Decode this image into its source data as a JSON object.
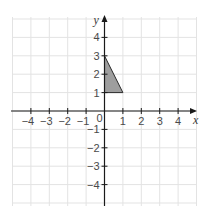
{
  "figure": {
    "grid": {
      "xmin": -5,
      "xmax": 5,
      "ymin": -5,
      "ymax": 5,
      "step": 1,
      "color": "#e3e3e3"
    },
    "axes": {
      "x_label": "x",
      "y_label": "y",
      "origin_label": "0",
      "color": "#1a1a1a",
      "x_ticks": [
        {
          "value": -4,
          "label": "−4"
        },
        {
          "value": -3,
          "label": "−3"
        },
        {
          "value": -2,
          "label": "−2"
        },
        {
          "value": -1,
          "label": "−1"
        },
        {
          "value": 1,
          "label": "1"
        },
        {
          "value": 2,
          "label": "2"
        },
        {
          "value": 3,
          "label": "3"
        },
        {
          "value": 4,
          "label": "4"
        }
      ],
      "y_ticks": [
        {
          "value": 4,
          "label": "4"
        },
        {
          "value": 3,
          "label": "3"
        },
        {
          "value": 2,
          "label": "2"
        },
        {
          "value": 1,
          "label": "1"
        },
        {
          "value": -1,
          "label": "−1"
        },
        {
          "value": -2,
          "label": "−2"
        },
        {
          "value": -3,
          "label": "−3"
        },
        {
          "value": -4,
          "label": "−4"
        }
      ]
    },
    "shape": {
      "type": "triangle",
      "vertices": [
        [
          0,
          3
        ],
        [
          0,
          1
        ],
        [
          1,
          1
        ]
      ],
      "fill": "#9e9e9e",
      "stroke": "#2a2a2a"
    }
  }
}
